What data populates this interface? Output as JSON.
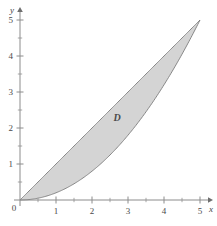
{
  "chart_data": {
    "type": "area",
    "title": "",
    "xlabel": "x",
    "ylabel": "y",
    "xlim": [
      0,
      5
    ],
    "ylim": [
      0,
      5
    ],
    "grid": false,
    "legend": "none",
    "x_ticks": [
      0,
      1,
      2,
      3,
      4,
      5
    ],
    "x_tick_labels": [
      "0",
      "1",
      "2",
      "3",
      "4",
      "5"
    ],
    "y_ticks": [
      0,
      1,
      2,
      3,
      4,
      5
    ],
    "y_tick_labels": [
      "0",
      "1",
      "2",
      "3",
      "4",
      "5"
    ],
    "x_minor_ticks": [
      0.5,
      1.5,
      2.5,
      3.5,
      4.5
    ],
    "y_minor_ticks": [
      0.5,
      1.5,
      2.5,
      3.5,
      4.5
    ],
    "annotations": [
      {
        "text": "D",
        "x": 2.7,
        "y": 2.2,
        "style": "italic-bold"
      }
    ],
    "series": [
      {
        "name": "upper boundary",
        "kind": "line",
        "expression": "y = x",
        "x": [
          0,
          0.5,
          1,
          1.5,
          2,
          2.5,
          3,
          3.5,
          4,
          4.5,
          5
        ],
        "values": [
          0,
          0.5,
          1,
          1.5,
          2,
          2.5,
          3,
          3.5,
          4,
          4.5,
          5
        ]
      },
      {
        "name": "lower boundary",
        "kind": "line",
        "expression": "y = x^2 / 5",
        "x": [
          0,
          0.5,
          1,
          1.5,
          2,
          2.5,
          3,
          3.5,
          4,
          4.5,
          5
        ],
        "values": [
          0,
          0.05,
          0.2,
          0.45,
          0.8,
          1.25,
          1.8,
          2.45,
          3.2,
          4.05,
          5
        ]
      }
    ],
    "shaded_region": {
      "label": "D",
      "between": [
        "lower boundary",
        "upper boundary"
      ],
      "fill_color": "#d2d2d2",
      "edge_color": "#7d7d7d",
      "intersections": [
        [
          0,
          0
        ],
        [
          5,
          5
        ]
      ]
    },
    "colors": {
      "axis": "#8c8c8c",
      "tick_label": "#4a4a4a",
      "fill": "#d2d2d2",
      "edge": "#7d7d7d",
      "background": "#ffffff"
    }
  },
  "axes": {
    "x_name": "x",
    "y_name": "y"
  }
}
